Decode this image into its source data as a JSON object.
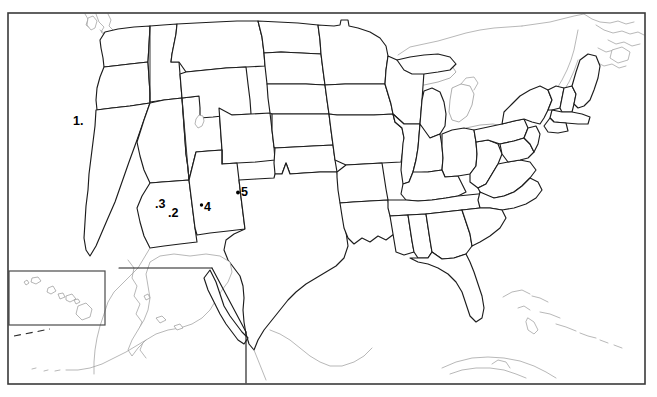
{
  "document": {
    "title": "United States Outline Map",
    "type": "blank-state-map-quiz",
    "description": "Black and white outline map of the United States with state borders, Alaska and Hawaii insets, and five numbered point markers in the southwestern states."
  },
  "frame": {
    "x": 8,
    "y": 13,
    "width": 637,
    "height": 371,
    "stroke_color": "#3a3a3a"
  },
  "insets": [
    {
      "name": "hawaii-inset",
      "label": "",
      "x": 9,
      "y": 271,
      "width": 96,
      "height": 54
    }
  ],
  "markers": [
    {
      "id": "marker-1",
      "label": "1.",
      "number": "1",
      "dot_side": "right",
      "text_x": 73,
      "text_y": 125,
      "dot_x": 91,
      "dot_y": 124,
      "state_hint": "Nevada"
    },
    {
      "id": "marker-2",
      "label": ".2",
      "number": "2",
      "dot_side": "left",
      "text_x": 171,
      "text_y": 216,
      "dot_x": 167,
      "dot_y": 214,
      "state_hint": "Arizona"
    },
    {
      "id": "marker-3",
      "label": ".3",
      "number": "3",
      "dot_side": "left",
      "text_x": 158,
      "text_y": 208,
      "dot_x": 154,
      "dot_y": 206,
      "state_hint": "Arizona"
    },
    {
      "id": "marker-4",
      "label": "4",
      "number": "4",
      "dot_side": "left",
      "text_x": 205,
      "text_y": 211,
      "dot_x": 201,
      "dot_y": 206,
      "state_hint": "New Mexico"
    },
    {
      "id": "marker-5",
      "label": "5",
      "number": "5",
      "dot_side": "left",
      "text_x": 243,
      "text_y": 196,
      "dot_x": 238,
      "dot_y": 193,
      "state_hint": "Colorado"
    }
  ],
  "colors": {
    "background": "#ffffff",
    "border": "#1c1c1c",
    "frame": "#3a3a3a",
    "coastline": "#9a9a9a",
    "marker": "#000000"
  },
  "regions": {
    "mainland": "contiguous-united-states",
    "alaska": "alaska-inset-lower-left",
    "hawaii": "hawaii-inset-boxed"
  }
}
